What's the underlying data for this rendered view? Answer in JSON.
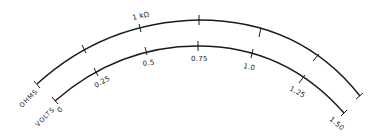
{
  "diagram": {
    "title": "",
    "type": "meter-scale",
    "colors": {
      "ink": "#1a1a1a",
      "background": "#ffffff"
    },
    "scales": [
      {
        "name": "OHMS",
        "labels": [
          "1 kΩ"
        ],
        "tick_count": 7
      },
      {
        "name": "VOLTS",
        "labels": [
          "0",
          "0.25",
          "0.5",
          "0.75",
          "1.0",
          "1.25",
          "1.50"
        ],
        "tick_count": 7
      }
    ],
    "ohms": {
      "name": "OHMS",
      "mark_1k": "1 kΩ"
    },
    "volts": {
      "name": "VOLTS",
      "v0": "0",
      "v025": "0.25",
      "v05": "0.5",
      "v075": "0.75",
      "v10": "1.0",
      "v125": "1.25",
      "v150": "1.50"
    }
  }
}
